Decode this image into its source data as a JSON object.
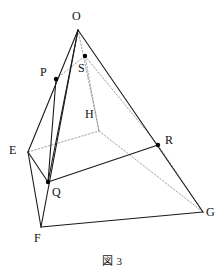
{
  "figure": {
    "caption": "図 3",
    "type": "geometric-diagram",
    "colors": {
      "solid_edge": "#1a1a1a",
      "hidden_edge": "#8c8c8c",
      "vertex_dot": "#000000",
      "background": "#ffffff",
      "label_text": "#111111"
    },
    "vertices": [
      {
        "id": "O",
        "label": "O",
        "x": 78,
        "y": 30,
        "dot": false,
        "label_x": 72,
        "label_y": 10
      },
      {
        "id": "S",
        "label": "S",
        "x": 85,
        "y": 56,
        "dot": true,
        "label_x": 78,
        "label_y": 62
      },
      {
        "id": "P",
        "label": "P",
        "x": 56,
        "y": 79,
        "dot": true,
        "label_x": 40,
        "label_y": 66
      },
      {
        "id": "H",
        "label": "H",
        "x": 99,
        "y": 131,
        "dot": false,
        "label_x": 85,
        "label_y": 108
      },
      {
        "id": "E",
        "label": "E",
        "x": 28,
        "y": 152,
        "dot": false,
        "label_x": 9,
        "label_y": 144
      },
      {
        "id": "R",
        "label": "R",
        "x": 158,
        "y": 145,
        "dot": true,
        "label_x": 165,
        "label_y": 134
      },
      {
        "id": "Q",
        "label": "Q",
        "x": 48,
        "y": 182,
        "dot": true,
        "label_x": 52,
        "label_y": 186
      },
      {
        "id": "G",
        "label": "G",
        "x": 203,
        "y": 212,
        "dot": false,
        "label_x": 206,
        "label_y": 206
      },
      {
        "id": "F",
        "label": "F",
        "x": 41,
        "y": 227,
        "dot": false,
        "label_x": 34,
        "label_y": 232
      }
    ],
    "solid_edges": [
      {
        "from": "O",
        "to": "E"
      },
      {
        "from": "O",
        "to": "F"
      },
      {
        "from": "O",
        "to": "G"
      },
      {
        "from": "E",
        "to": "F"
      },
      {
        "from": "F",
        "to": "G"
      },
      {
        "from": "P",
        "to": "Q"
      },
      {
        "from": "Q",
        "to": "R"
      },
      {
        "from": "E",
        "to": "Q"
      },
      {
        "from": "O",
        "to": "Q"
      }
    ],
    "hidden_edges": [
      {
        "from": "O",
        "to": "H"
      },
      {
        "from": "E",
        "to": "H"
      },
      {
        "from": "H",
        "to": "G"
      },
      {
        "from": "S",
        "to": "H"
      },
      {
        "from": "P",
        "to": "S"
      },
      {
        "from": "S",
        "to": "R"
      },
      {
        "from": "R",
        "to": "G"
      }
    ],
    "points_on_edges": [
      {
        "point": "P",
        "edge": "OE"
      },
      {
        "point": "Q",
        "edge": "OF"
      },
      {
        "point": "R",
        "edge": "OG"
      },
      {
        "point": "S",
        "edge": "OH"
      }
    ]
  }
}
